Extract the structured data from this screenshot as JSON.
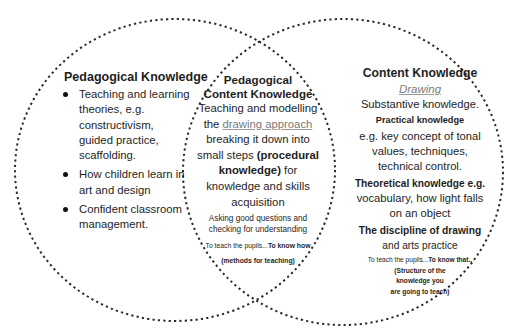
{
  "diagram": {
    "type": "venn",
    "circles": [
      {
        "id": "pedagogical-knowledge",
        "stroke": "#2a2a2a",
        "style": "dotted"
      },
      {
        "id": "content-knowledge",
        "stroke": "#2a2a2a",
        "style": "dotted"
      }
    ],
    "left": {
      "title": "Pedagogical Knowledge",
      "items": [
        "Teaching and learning theories, e.g. constructivism, guided practice, scaffolding.",
        "How children learn in art and design",
        "Confident classroom management."
      ]
    },
    "overlap": {
      "title_line1": "Pedagogical",
      "title_line2": "Content Knowledge",
      "text_a": "Teaching and modelling the ",
      "link": "drawing approach",
      "text_b": " breaking it down into small steps ",
      "bold_a": "(procedural knowledge)",
      "text_c": " for knowledge and skills acquisition",
      "questions": "Asking good questions and checking for understanding",
      "teach_prefix": "To teach the pupils...",
      "teach_bold": "To know how",
      "methods": "(methods for teaching)"
    },
    "right": {
      "title": "Content Knowledge",
      "subject": "Drawing",
      "substantive": "Substantive knowledge.",
      "practical_heading": "Practical knowledge",
      "practical_text": "e.g. key concept of tonal values, techniques, technical control.",
      "theoretical_heading": "Theoretical knowledge e.g.",
      "theoretical_text": "vocabulary, how light falls on an object",
      "discipline_heading": "The discipline of drawing",
      "discipline_text": "and arts practice",
      "teach_prefix": "To teach the pupils...",
      "teach_bold": "To know that..",
      "structure_line1": "(Structure of the",
      "structure_line2": "knowledge you",
      "structure_line3": "are going to teach)"
    }
  }
}
